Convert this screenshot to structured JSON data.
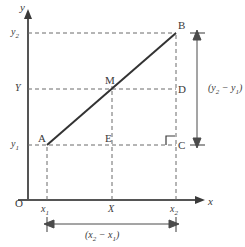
{
  "figure": {
    "type": "coordinate-geometry-diagram",
    "colors": {
      "ink": "#3a3a3a",
      "axis": "#555555",
      "dashed": "#6b6b6b",
      "segment": "#333333",
      "background": "#ffffff"
    }
  },
  "axes": {
    "x_axis_label": "x",
    "y_axis_label": "y",
    "origin_label": "O"
  },
  "x_ticks": [
    {
      "id": "x1",
      "main": "x",
      "sub": "1"
    },
    {
      "id": "X",
      "main": "X",
      "sub": ""
    },
    {
      "id": "x2",
      "main": "x",
      "sub": "2"
    }
  ],
  "y_ticks": [
    {
      "id": "y2",
      "main": "y",
      "sub": "2"
    },
    {
      "id": "Y",
      "main": "Y",
      "sub": ""
    },
    {
      "id": "y1",
      "main": "y",
      "sub": "1"
    }
  ],
  "points": [
    {
      "name": "A",
      "label": "A",
      "role": "segment-endpoint-lower-left"
    },
    {
      "name": "B",
      "label": "B",
      "role": "segment-endpoint-upper-right"
    },
    {
      "name": "M",
      "label": "M",
      "role": "midpoint"
    },
    {
      "name": "C",
      "label": "C",
      "role": "right-angle-vertex"
    },
    {
      "name": "D",
      "label": "D",
      "role": "projection-of-M-on-BC"
    },
    {
      "name": "E",
      "label": "E",
      "role": "projection-of-M-on-AC"
    }
  ],
  "brackets": {
    "horizontal": {
      "main_open": "(",
      "term1": "x",
      "term1_sub": "2",
      "minus": " − ",
      "term2": "x",
      "term2_sub": "1",
      "main_close": ")",
      "text": "(x2 − x1)"
    },
    "vertical": {
      "main_open": "(",
      "term1": "y",
      "term1_sub": "2",
      "minus": " − ",
      "term2": "y",
      "term2_sub": "1",
      "main_close": ")",
      "text": "(y2 − y1)"
    }
  },
  "geometry": {
    "origin": {
      "x": 28,
      "y": 200
    },
    "A": {
      "x": 47,
      "y": 145
    },
    "B": {
      "x": 176,
      "y": 33
    },
    "M": {
      "x": 112,
      "y": 89
    },
    "C": {
      "x": 176,
      "y": 145
    },
    "D": {
      "x": 176,
      "y": 89
    },
    "E": {
      "x": 112,
      "y": 145
    }
  }
}
